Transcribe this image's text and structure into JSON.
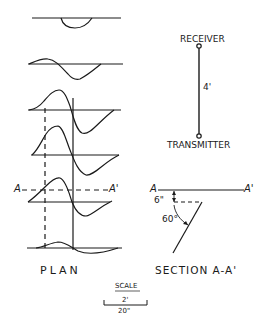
{
  "plan": {
    "label": "PLAN",
    "section_marker_left": "A",
    "section_marker_right": "A'",
    "trace_count": 6
  },
  "antenna": {
    "receiver_label": "RECEIVER",
    "transmitter_label": "TRANSMITTER",
    "separation_label": "4'"
  },
  "section": {
    "label": "SECTION A-A'",
    "marker_left": "A",
    "marker_right": "A'",
    "depth_label": "6\"",
    "angle_label": "60°"
  },
  "scale": {
    "title": "SCALE",
    "horizontal": "2'",
    "vertical": "20\""
  },
  "colors": {
    "ink": "#1a1a1a",
    "background": "#ffffff"
  }
}
